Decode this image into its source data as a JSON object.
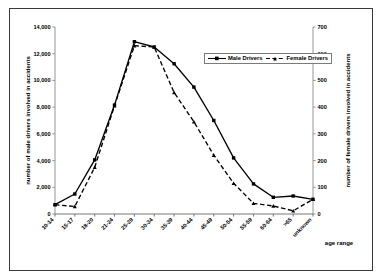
{
  "chart_data": {
    "type": "line",
    "title": "",
    "xlabel": "age range",
    "ylabel": "number of male drivers involved in accidents",
    "y2label": "number of female drivers involved in accidents",
    "categories": [
      "10-14",
      "15-17",
      "18-20",
      "21-24",
      "25-29",
      "30-34",
      "35-39",
      "40-44",
      "45-49",
      "50-54",
      "55-59",
      "60-64",
      ">65",
      "unknown"
    ],
    "ylim": [
      0,
      14000
    ],
    "y2lim": [
      0,
      700
    ],
    "yticks": [
      "0",
      "2,000",
      "4,000",
      "6,000",
      "8,000",
      "10,000",
      "12,000",
      "14,000"
    ],
    "ytick_values": [
      0,
      2000,
      4000,
      6000,
      8000,
      10000,
      12000,
      14000
    ],
    "y2ticks": [
      "0",
      "100",
      "200",
      "300",
      "400",
      "500",
      "600",
      "700"
    ],
    "y2tick_values": [
      0,
      100,
      200,
      300,
      400,
      500,
      600,
      700
    ],
    "grid": false,
    "legend_position": "top-right",
    "series": [
      {
        "name": "Male Drivers",
        "axis": "left",
        "line_style": "solid",
        "marker": "square",
        "color": "#000000",
        "values": [
          700,
          1500,
          4050,
          8150,
          12900,
          12500,
          11250,
          9500,
          7000,
          4200,
          2250,
          1250,
          1350,
          1100
        ]
      },
      {
        "name": "Female Drivers",
        "axis": "right",
        "line_style": "dashed",
        "marker": "triangle",
        "color": "#000000",
        "values": [
          35,
          28,
          175,
          405,
          630,
          625,
          455,
          345,
          220,
          115,
          40,
          30,
          12,
          55
        ]
      }
    ]
  },
  "legend": {
    "items": [
      {
        "label": "Male Drivers",
        "style": "solid"
      },
      {
        "label": "Female Drivers",
        "style": "dashed"
      }
    ]
  },
  "axes": {
    "left_title": "number of male drivers involved in accidents",
    "right_title": "number of female drivers involved in accidents",
    "x_title": "age range"
  }
}
